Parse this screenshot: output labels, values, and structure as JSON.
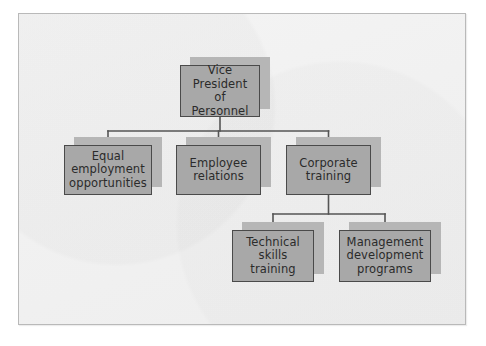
{
  "diagram": {
    "type": "organizational-chart",
    "colors": {
      "page_background": "#ffffff",
      "frame_background": "#f2f2f2",
      "frame_border": "#b9b9b9",
      "node_fill": "#a8a8a8",
      "node_border": "#4a4a4a",
      "node_shadow": "#b6b6b6",
      "connector": "#555555",
      "text": "#2b2b2b"
    },
    "levels": 3,
    "nodes": [
      {
        "id": "vp",
        "label": "Vice\nPresident\nof Personnel",
        "level": 1,
        "parent": null,
        "x": 180,
        "y": 65,
        "w": 80,
        "h": 52
      },
      {
        "id": "eeo",
        "label": "Equal\nemployment\nopportunities",
        "level": 2,
        "parent": "vp",
        "x": 64,
        "y": 145,
        "w": 88,
        "h": 50
      },
      {
        "id": "employee-relations",
        "label": "Employee\nrelations",
        "level": 2,
        "parent": "vp",
        "x": 176,
        "y": 145,
        "w": 85,
        "h": 50
      },
      {
        "id": "corporate-training",
        "label": "Corporate\ntraining",
        "level": 2,
        "parent": "vp",
        "x": 286,
        "y": 145,
        "w": 85,
        "h": 50
      },
      {
        "id": "technical-skills",
        "label": "Technical\nskills\ntraining",
        "level": 3,
        "parent": "corporate-training",
        "x": 232,
        "y": 230,
        "w": 82,
        "h": 52
      },
      {
        "id": "management-development",
        "label": "Management\ndevelopment\nprograms",
        "level": 3,
        "parent": "corporate-training",
        "x": 339,
        "y": 230,
        "w": 92,
        "h": 52
      }
    ],
    "connectors": [
      {
        "id": "vp-to-level2",
        "from": "vp",
        "to": [
          "eeo",
          "employee-relations",
          "corporate-training"
        ],
        "style": "orthogonal-bus",
        "bus_y": 131
      },
      {
        "id": "training-to-level3",
        "from": "corporate-training",
        "to": [
          "technical-skills",
          "management-development"
        ],
        "style": "orthogonal-bus",
        "bus_y": 214
      }
    ]
  }
}
